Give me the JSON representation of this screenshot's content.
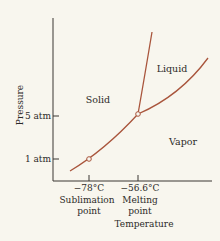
{
  "diagram": {
    "type": "phase-diagram",
    "substance": "CO2",
    "colors": {
      "curve": "#a9553c",
      "axis": "#3a3632",
      "text": "#2c2a28",
      "background": "#f8f6ee"
    },
    "axes": {
      "x_label": "Temperature",
      "y_label": "Pressure",
      "x_ticks": [
        {
          "value": -78,
          "label": "−78°C",
          "caption_line1": "Sublimation",
          "caption_line2": "point"
        },
        {
          "value": -56.6,
          "label": "−56.6°C",
          "caption_line1": "Melting",
          "caption_line2": "point"
        }
      ],
      "y_ticks": [
        {
          "value": 1,
          "label": "1 atm"
        },
        {
          "value": 5,
          "label": "5 atm"
        }
      ]
    },
    "regions": [
      {
        "name": "solid",
        "label": "Solid"
      },
      {
        "name": "liquid",
        "label": "Liquid"
      },
      {
        "name": "vapor",
        "label": "Vapor"
      }
    ],
    "curves": [
      {
        "name": "sublimation-curve",
        "description": "solid-vapor boundary"
      },
      {
        "name": "melting-curve",
        "description": "solid-liquid boundary"
      },
      {
        "name": "vaporization-curve",
        "description": "liquid-vapor boundary"
      }
    ],
    "points": [
      {
        "name": "sublimation-point",
        "temperature_c": -78,
        "pressure_atm": 1
      },
      {
        "name": "triple-point",
        "temperature_c": -56.6,
        "pressure_atm": 5
      }
    ]
  }
}
